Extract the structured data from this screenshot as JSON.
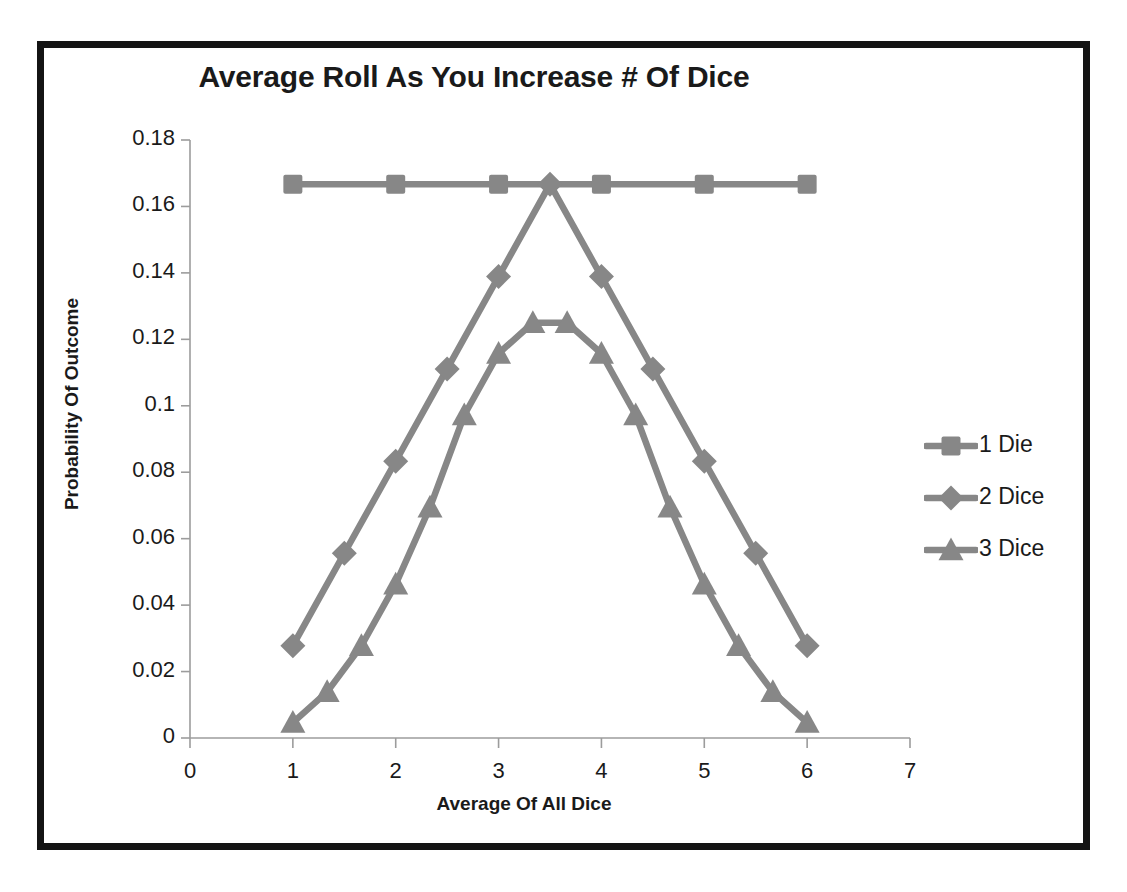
{
  "chart_data": {
    "type": "line",
    "title": "Average Roll As You Increase # Of Dice",
    "xlabel": "Average Of All Dice",
    "ylabel": "Probability Of Outcome",
    "xlim": [
      0,
      7
    ],
    "ylim": [
      0,
      0.18
    ],
    "grid": false,
    "legend_position": "right",
    "xticks": [
      "0",
      "1",
      "2",
      "3",
      "4",
      "5",
      "6",
      "7"
    ],
    "xtick_values": [
      0,
      1,
      2,
      3,
      4,
      5,
      6,
      7
    ],
    "yticks": [
      "0",
      "0.02",
      "0.04",
      "0.06",
      "0.08",
      "0.1",
      "0.12",
      "0.14",
      "0.16",
      "0.18"
    ],
    "ytick_values": [
      0,
      0.02,
      0.04,
      0.06,
      0.08,
      0.1,
      0.12,
      0.14,
      0.16,
      0.18
    ],
    "series": [
      {
        "name": "1 Die",
        "marker": "square",
        "color": "#878787",
        "x": [
          1,
          2,
          3,
          4,
          5,
          6
        ],
        "values": [
          0.1667,
          0.1667,
          0.1667,
          0.1667,
          0.1667,
          0.1667
        ]
      },
      {
        "name": "2 Dice",
        "marker": "diamond",
        "color": "#878787",
        "x": [
          1,
          1.5,
          2,
          2.5,
          3,
          3.5,
          4,
          4.5,
          5,
          5.5,
          6
        ],
        "values": [
          0.0278,
          0.0556,
          0.0833,
          0.1111,
          0.1389,
          0.1667,
          0.1389,
          0.1111,
          0.0833,
          0.0556,
          0.0278
        ]
      },
      {
        "name": "3 Dice",
        "marker": "triangle",
        "color": "#878787",
        "x": [
          1,
          1.3333,
          1.6667,
          2,
          2.3333,
          2.6667,
          3,
          3.3333,
          3.6667,
          4,
          4.3333,
          4.6667,
          5,
          5.3333,
          5.6667,
          6
        ],
        "values": [
          0.00463,
          0.01389,
          0.02778,
          0.0463,
          0.06944,
          0.09722,
          0.11574,
          0.125,
          0.125,
          0.11574,
          0.09722,
          0.06944,
          0.0463,
          0.02778,
          0.01389,
          0.00463
        ]
      }
    ]
  },
  "legend": {
    "items": [
      {
        "label": "1 Die",
        "marker": "square"
      },
      {
        "label": "2 Dice",
        "marker": "diamond"
      },
      {
        "label": "3 Dice",
        "marker": "triangle"
      }
    ]
  },
  "colors": {
    "series": "#878787",
    "axis": "#9c9c9c",
    "text": "#1a1a1a",
    "frame": "#141414",
    "background": "#ffffff"
  }
}
